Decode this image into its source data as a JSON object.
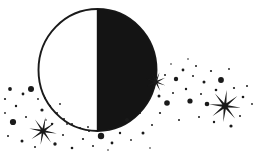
{
  "artwork": {
    "title": "First Quarter Moon with Starfield",
    "subject": "moon",
    "style": "black-and-white clipart",
    "width": 261,
    "height": 156,
    "background_color": "#ffffff",
    "ink_color": "#1a1a1a"
  },
  "moon": {
    "label": "first-quarter moon",
    "center_x": 97.5,
    "center_y": 70,
    "radius_x": 59,
    "radius_y": 61,
    "lit_side": "left",
    "lit_color": "#ffffff",
    "shadow_side": "right",
    "shadow_color": "#141414",
    "outline_color": "#1a1a1a",
    "outline_width": 1.9,
    "terminator_x": 97.5
  },
  "starbursts": [
    {
      "name": "starburst-left",
      "cx": 43,
      "cy": 131,
      "outer": 14,
      "inner": 2.6,
      "points": 8,
      "rotation": 10
    },
    {
      "name": "starburst-right",
      "cx": 225,
      "cy": 106,
      "outer": 16,
      "inner": 3.0,
      "points": 8,
      "rotation": 6
    },
    {
      "name": "starburst-limb",
      "cx": 156,
      "cy": 82,
      "outer": 10,
      "inner": 2.0,
      "points": 8,
      "rotation": 20
    }
  ],
  "dots": [
    {
      "cx": 10,
      "cy": 89,
      "r": 1.9
    },
    {
      "cx": 23,
      "cy": 94,
      "r": 1.4
    },
    {
      "cx": 5,
      "cy": 99,
      "r": 1.1
    },
    {
      "cx": 31,
      "cy": 89,
      "r": 3.0
    },
    {
      "cx": 16,
      "cy": 106,
      "r": 1.2
    },
    {
      "cx": 13,
      "cy": 122,
      "r": 3.1
    },
    {
      "cx": 5,
      "cy": 113,
      "r": 0.9
    },
    {
      "cx": 26,
      "cy": 117,
      "r": 1.0
    },
    {
      "cx": 42,
      "cy": 110,
      "r": 1.6
    },
    {
      "cx": 38,
      "cy": 99,
      "r": 0.9
    },
    {
      "cx": 22,
      "cy": 141,
      "r": 1.5
    },
    {
      "cx": 8,
      "cy": 136,
      "r": 1.0
    },
    {
      "cx": 35,
      "cy": 147,
      "r": 1.0
    },
    {
      "cx": 55,
      "cy": 144,
      "r": 1.7
    },
    {
      "cx": 63,
      "cy": 135,
      "r": 1.0
    },
    {
      "cx": 52,
      "cy": 124,
      "r": 1.2
    },
    {
      "cx": 72,
      "cy": 148,
      "r": 1.3
    },
    {
      "cx": 83,
      "cy": 139,
      "r": 1.1
    },
    {
      "cx": 93,
      "cy": 146,
      "r": 1.0
    },
    {
      "cx": 101,
      "cy": 136,
      "r": 3.2
    },
    {
      "cx": 112,
      "cy": 143,
      "r": 1.4
    },
    {
      "cx": 120,
      "cy": 133,
      "r": 1.2
    },
    {
      "cx": 131,
      "cy": 140,
      "r": 0.9
    },
    {
      "cx": 143,
      "cy": 133,
      "r": 1.5
    },
    {
      "cx": 127,
      "cy": 120,
      "r": 2.0
    },
    {
      "cx": 152,
      "cy": 125,
      "r": 1.0
    },
    {
      "cx": 160,
      "cy": 113,
      "r": 1.1
    },
    {
      "cx": 167,
      "cy": 103,
      "r": 2.8
    },
    {
      "cx": 159,
      "cy": 96,
      "r": 1.5
    },
    {
      "cx": 173,
      "cy": 93,
      "r": 1.0
    },
    {
      "cx": 165,
      "cy": 75,
      "r": 1.0
    },
    {
      "cx": 176,
      "cy": 79,
      "r": 2.2
    },
    {
      "cx": 186,
      "cy": 89,
      "r": 1.2
    },
    {
      "cx": 183,
      "cy": 70,
      "r": 1.4
    },
    {
      "cx": 193,
      "cy": 76,
      "r": 1.0
    },
    {
      "cx": 190,
      "cy": 101,
      "r": 2.6
    },
    {
      "cx": 201,
      "cy": 94,
      "r": 1.0
    },
    {
      "cx": 204,
      "cy": 82,
      "r": 1.5
    },
    {
      "cx": 196,
      "cy": 66,
      "r": 1.0
    },
    {
      "cx": 211,
      "cy": 71,
      "r": 1.1
    },
    {
      "cx": 207,
      "cy": 104,
      "r": 2.3
    },
    {
      "cx": 216,
      "cy": 90,
      "r": 1.3
    },
    {
      "cx": 221,
      "cy": 80,
      "r": 2.9
    },
    {
      "cx": 214,
      "cy": 122,
      "r": 1.2
    },
    {
      "cx": 231,
      "cy": 126,
      "r": 1.6
    },
    {
      "cx": 240,
      "cy": 116,
      "r": 1.0
    },
    {
      "cx": 243,
      "cy": 97,
      "r": 1.3
    },
    {
      "cx": 247,
      "cy": 86,
      "r": 1.0
    },
    {
      "cx": 234,
      "cy": 88,
      "r": 1.1
    },
    {
      "cx": 199,
      "cy": 117,
      "r": 1.0
    },
    {
      "cx": 179,
      "cy": 120,
      "r": 1.0
    },
    {
      "cx": 171,
      "cy": 64,
      "r": 0.8
    },
    {
      "cx": 188,
      "cy": 59,
      "r": 0.8
    },
    {
      "cx": 229,
      "cy": 69,
      "r": 0.9
    },
    {
      "cx": 252,
      "cy": 104,
      "r": 0.9
    },
    {
      "cx": 60,
      "cy": 104,
      "r": 0.9
    },
    {
      "cx": 46,
      "cy": 120,
      "r": 0.8
    },
    {
      "cx": 67,
      "cy": 124,
      "r": 0.9
    },
    {
      "cx": 88,
      "cy": 127,
      "r": 0.9
    },
    {
      "cx": 150,
      "cy": 148,
      "r": 0.8
    },
    {
      "cx": 108,
      "cy": 150,
      "r": 0.8
    },
    {
      "cx": 140,
      "cy": 113,
      "r": 1.0
    }
  ],
  "limb_dots": [
    {
      "cx": 57,
      "cy": 113,
      "r": 1.0
    },
    {
      "cx": 64,
      "cy": 119,
      "r": 1.0
    },
    {
      "cx": 72,
      "cy": 124,
      "r": 1.0
    },
    {
      "cx": 80,
      "cy": 128,
      "r": 1.0
    },
    {
      "cx": 89,
      "cy": 131,
      "r": 1.0
    },
    {
      "cx": 50,
      "cy": 106,
      "r": 0.9
    },
    {
      "cx": 45,
      "cy": 98,
      "r": 0.9
    }
  ]
}
